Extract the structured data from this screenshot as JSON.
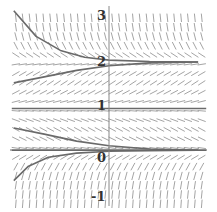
{
  "chart_data": {
    "type": "line",
    "subtype": "slope-field",
    "title": "",
    "xlabel": "",
    "ylabel": "",
    "equation_hint": "dy/dx = -c (y - 0.1)(y - 1)(y - 2)",
    "ylim": [
      -1.2,
      3.2
    ],
    "xlim": [
      -2.4,
      2.4
    ],
    "y_ticks": [
      "3",
      "2",
      "1",
      "0",
      "-1"
    ],
    "y_tick_values": [
      3,
      2,
      1,
      0,
      -1
    ],
    "grid": false,
    "equilibria": [
      0.1,
      1,
      2
    ],
    "series": [
      {
        "name": "solution-above-2",
        "x": [
          -2.35,
          -1.8,
          -1.2,
          -0.6,
          0,
          1,
          2.2
        ],
        "y": [
          3.1,
          2.55,
          2.25,
          2.1,
          2.04,
          2.01,
          2.0
        ]
      },
      {
        "name": "solution-between-1-2",
        "x": [
          -2.35,
          -1.6,
          -0.8,
          0,
          1,
          2.2
        ],
        "y": [
          1.55,
          1.68,
          1.82,
          1.92,
          1.98,
          2.0
        ]
      },
      {
        "name": "equilibrium-1",
        "x": [
          -2.4,
          2.4
        ],
        "y": [
          1,
          1
        ]
      },
      {
        "name": "solution-between-0.1-1",
        "x": [
          -2.35,
          -1.6,
          -0.8,
          0,
          1,
          2.2
        ],
        "y": [
          0.58,
          0.45,
          0.3,
          0.2,
          0.13,
          0.1
        ]
      },
      {
        "name": "equilibrium-0.1",
        "x": [
          -2.4,
          2.4
        ],
        "y": [
          0.1,
          0.1
        ]
      },
      {
        "name": "solution-below-0.1",
        "x": [
          -2.35,
          -2.0,
          -1.5,
          -0.8,
          0,
          1,
          2.2
        ],
        "y": [
          -0.55,
          -0.25,
          -0.05,
          0.04,
          0.08,
          0.095,
          0.1
        ]
      }
    ]
  },
  "axes": {
    "y_labels": [
      {
        "text": "3",
        "value": 3
      },
      {
        "text": "2",
        "value": 2
      },
      {
        "text": "1",
        "value": 1
      },
      {
        "text": "0",
        "value": 0
      },
      {
        "text": "-1",
        "value": -1
      }
    ]
  }
}
